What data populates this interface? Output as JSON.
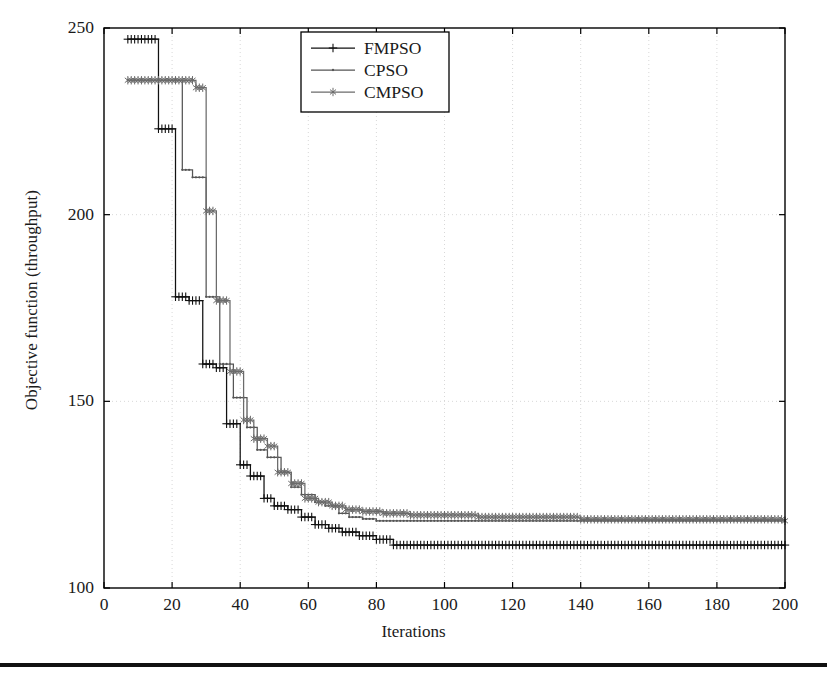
{
  "figure": {
    "background": "#ffffff",
    "bottom_rule_color": "#111111"
  },
  "axes": {
    "x_label": "Iterations",
    "y_label": "Objective function (throughput)",
    "x_ticks": [
      0,
      20,
      40,
      60,
      80,
      100,
      120,
      140,
      160,
      180,
      200
    ],
    "y_ticks": [
      100,
      150,
      200,
      250
    ],
    "x_tick_labels": [
      "0",
      "20",
      "40",
      "60",
      "80",
      "100",
      "120",
      "140",
      "160",
      "180",
      "200"
    ],
    "y_tick_labels": [
      "100",
      "150",
      "200",
      "250"
    ],
    "grid": true,
    "grid_color": "#d8d8d8",
    "frame_color": "#000000"
  },
  "legend": {
    "position": "top-center",
    "border_color": "#000000",
    "entries": [
      {
        "label": "FMPSO",
        "color": "#111111",
        "marker": "plus"
      },
      {
        "label": "CPSO",
        "color": "#555555",
        "marker": "dot"
      },
      {
        "label": "CMPSO",
        "color": "#6b6b6b",
        "marker": "star"
      }
    ]
  },
  "chart_data": {
    "type": "line",
    "title": "",
    "xlabel": "Iterations",
    "ylabel": "Objective function (throughput)",
    "xlim": [
      0,
      200
    ],
    "ylim": [
      100,
      250
    ],
    "grid": true,
    "legend_position": "top-center",
    "step_style": "post",
    "series": [
      {
        "name": "FMPSO",
        "color": "#111111",
        "marker": "plus",
        "x": [
          7,
          16,
          21,
          25,
          29,
          33,
          36,
          40,
          43,
          47,
          50,
          54,
          58,
          62,
          66,
          70,
          75,
          80,
          85,
          200
        ],
        "values": [
          247,
          223,
          178,
          177,
          160,
          159,
          144,
          133,
          130,
          124,
          122,
          121,
          119,
          117,
          116,
          115,
          114,
          113,
          111.5,
          111.5
        ]
      },
      {
        "name": "CPSO",
        "color": "#555555",
        "marker": "dot",
        "x": [
          7,
          23,
          26,
          30,
          34,
          38,
          42,
          45,
          48,
          52,
          55,
          58,
          62,
          65,
          69,
          72,
          76,
          80,
          200
        ],
        "values": [
          236,
          212,
          210,
          178,
          160,
          151,
          143,
          137,
          135,
          131,
          127,
          125,
          123,
          122,
          120,
          119,
          118.5,
          118,
          118
        ]
      },
      {
        "name": "CMPSO",
        "color": "#6b6b6b",
        "marker": "star",
        "x": [
          7,
          27,
          30,
          33,
          37,
          41,
          44,
          48,
          51,
          55,
          59,
          63,
          67,
          71,
          76,
          82,
          90,
          110,
          140,
          200
        ],
        "values": [
          236,
          234,
          201,
          177,
          158,
          145,
          140,
          138,
          131,
          128,
          124,
          123,
          122,
          121,
          120.5,
          120,
          119.5,
          119,
          118.4,
          118
        ]
      }
    ]
  },
  "geometry": {
    "plot_left": 104,
    "plot_right": 785,
    "plot_top": 28,
    "plot_bottom": 588
  }
}
